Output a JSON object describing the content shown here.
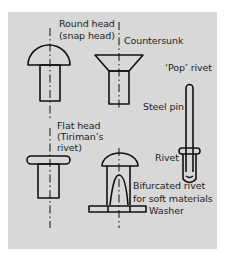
{
  "diagram": {
    "type": "rivet-types-illustration",
    "background_color": "#d8d8d8",
    "line_color": "#111111",
    "labels": {
      "round_head_1": "Round head",
      "round_head_2": "(snap head)",
      "countersunk": "Countersunk",
      "pop_rivet": "‘Pop’ rivet",
      "steel_pin": "Steel pin",
      "flat_head_1": "Flat head",
      "flat_head_2": "(Tiriman’s",
      "flat_head_3": "rivet)",
      "rivet": "Rivet",
      "bifurcated_1": "Bifurcated rivet",
      "bifurcated_2": "for soft materials",
      "washer": "Washer"
    },
    "items": [
      {
        "name": "Round head (snap head)"
      },
      {
        "name": "Countersunk"
      },
      {
        "name": "Flat head (Tiriman's rivet)"
      },
      {
        "name": "Bifurcated rivet for soft materials",
        "part": "Washer"
      },
      {
        "name": "'Pop' rivet",
        "parts": [
          "Steel pin",
          "Rivet"
        ]
      }
    ]
  }
}
